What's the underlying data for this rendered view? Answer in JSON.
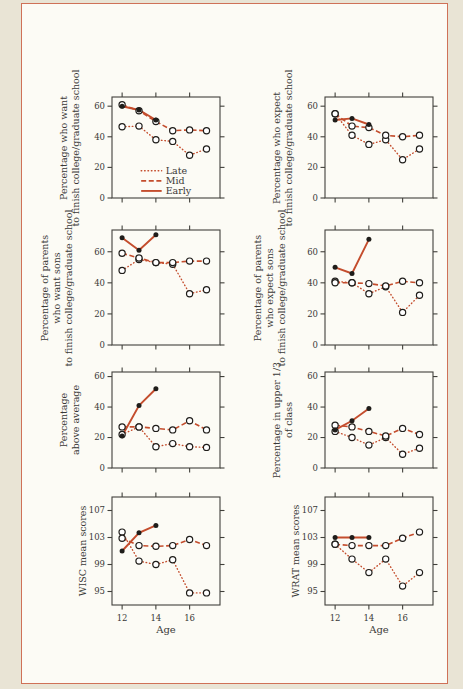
{
  "page": {
    "bg_outer": "#e9e4d5",
    "paper": "#fcfbf5",
    "frame_color": "#cf7157",
    "accent": "#c44d2d",
    "axis_color": "#41403b",
    "marker_color": "#1f1d1a",
    "text_color": "#3a3937"
  },
  "legend": {
    "items": [
      {
        "label": "Late",
        "style": "dotted"
      },
      {
        "label": "Mid",
        "style": "dashed"
      },
      {
        "label": "Early",
        "style": "solid"
      }
    ]
  },
  "x_axis": {
    "label": "Age",
    "ages": [
      12,
      13,
      14,
      15,
      16,
      17
    ],
    "ticks": [
      12,
      14,
      16
    ],
    "range": [
      11.4,
      17.8
    ]
  },
  "chart_data": [
    {
      "id": "chart-want-college",
      "type": "line",
      "ylabel": "Percentage who want\nto finish college/graduate school",
      "ylim": [
        0,
        66
      ],
      "yticks": [
        0,
        20,
        40,
        60
      ],
      "show_x_labels": false,
      "show_legend": true,
      "layout": {
        "x": 112,
        "y": 97,
        "w": 108,
        "h": 101
      },
      "series": [
        {
          "name": "Late",
          "style": "dotted",
          "marker": "open",
          "values": [
            46.5,
            47,
            38,
            37,
            28,
            32
          ]
        },
        {
          "name": "Mid",
          "style": "dashed",
          "marker": "open",
          "values": [
            61,
            57,
            50,
            44,
            44.5,
            44
          ]
        },
        {
          "name": "Early",
          "style": "solid",
          "marker": "filled",
          "values": [
            60,
            57.5,
            51,
            null,
            null,
            null
          ]
        }
      ]
    },
    {
      "id": "chart-expect-college",
      "type": "line",
      "ylabel": "Percentage who expect\nto finish college/graduate school",
      "ylim": [
        0,
        66
      ],
      "yticks": [
        0,
        20,
        40,
        60
      ],
      "show_x_labels": false,
      "show_legend": false,
      "layout": {
        "x": 325,
        "y": 97,
        "w": 108,
        "h": 101
      },
      "series": [
        {
          "name": "Late",
          "style": "dotted",
          "marker": "open",
          "values": [
            55,
            41,
            35,
            38,
            25,
            32
          ]
        },
        {
          "name": "Mid",
          "style": "dashed",
          "marker": "open",
          "values": [
            55,
            47,
            46,
            41,
            40,
            41
          ]
        },
        {
          "name": "Early",
          "style": "solid",
          "marker": "filled",
          "values": [
            51,
            52,
            48,
            null,
            null,
            null
          ]
        }
      ]
    },
    {
      "id": "chart-parents-want",
      "type": "line",
      "ylabel": "Percentage of parents\nwho want sons\nto finish college/graduate school",
      "ylim": [
        0,
        74
      ],
      "yticks": [
        0,
        20,
        40,
        60
      ],
      "show_x_labels": false,
      "show_legend": false,
      "layout": {
        "x": 112,
        "y": 230,
        "w": 108,
        "h": 115
      },
      "series": [
        {
          "name": "Late",
          "style": "dotted",
          "marker": "open",
          "values": [
            48,
            55,
            53,
            52,
            33,
            35.5
          ]
        },
        {
          "name": "Mid",
          "style": "dashed",
          "marker": "open",
          "values": [
            59,
            56,
            53,
            53,
            54,
            54
          ]
        },
        {
          "name": "Early",
          "style": "solid",
          "marker": "filled",
          "values": [
            69,
            61,
            71,
            null,
            null,
            null
          ]
        }
      ]
    },
    {
      "id": "chart-parents-expect",
      "type": "line",
      "ylabel": "Percentage of parents\nwho expect sons\nto finish college/graduate school",
      "ylim": [
        0,
        74
      ],
      "yticks": [
        0,
        20,
        40,
        60
      ],
      "show_x_labels": false,
      "show_legend": false,
      "layout": {
        "x": 325,
        "y": 230,
        "w": 108,
        "h": 115
      },
      "series": [
        {
          "name": "Late",
          "style": "dotted",
          "marker": "open",
          "values": [
            41,
            40,
            33,
            37.5,
            21,
            32
          ]
        },
        {
          "name": "Mid",
          "style": "dashed",
          "marker": "open",
          "values": [
            40,
            40,
            39.5,
            38,
            41,
            40
          ]
        },
        {
          "name": "Early",
          "style": "solid",
          "marker": "filled",
          "values": [
            50,
            46,
            68,
            null,
            null,
            null
          ]
        }
      ]
    },
    {
      "id": "chart-above-average",
      "type": "line",
      "ylabel": "Percentage\nabove average",
      "ylim": [
        0,
        63
      ],
      "yticks": [
        0,
        20,
        40,
        60
      ],
      "show_x_labels": false,
      "show_legend": false,
      "layout": {
        "x": 112,
        "y": 372,
        "w": 108,
        "h": 96
      },
      "series": [
        {
          "name": "Late",
          "style": "dotted",
          "marker": "open",
          "values": [
            22,
            27,
            14,
            16,
            14,
            13.5
          ]
        },
        {
          "name": "Mid",
          "style": "dashed",
          "marker": "open",
          "values": [
            27,
            27,
            26,
            25,
            31,
            25
          ]
        },
        {
          "name": "Early",
          "style": "solid",
          "marker": "filled",
          "values": [
            21,
            41,
            52,
            null,
            null,
            null
          ]
        }
      ]
    },
    {
      "id": "chart-upper-third",
      "type": "line",
      "ylabel": "Percentage in upper 1/3\nof class",
      "ylim": [
        0,
        63
      ],
      "yticks": [
        0,
        20,
        40,
        60
      ],
      "show_x_labels": false,
      "show_legend": false,
      "layout": {
        "x": 325,
        "y": 372,
        "w": 108,
        "h": 96
      },
      "series": [
        {
          "name": "Late",
          "style": "dotted",
          "marker": "open",
          "values": [
            24,
            20,
            15,
            20,
            9,
            13
          ]
        },
        {
          "name": "Mid",
          "style": "dashed",
          "marker": "open",
          "values": [
            28,
            27,
            24,
            21,
            26,
            22
          ]
        },
        {
          "name": "Early",
          "style": "solid",
          "marker": "filled",
          "values": [
            25,
            31,
            39,
            null,
            null,
            null
          ]
        }
      ]
    },
    {
      "id": "chart-wisc",
      "type": "line",
      "ylabel": "WISC mean scores",
      "ylim": [
        93,
        109
      ],
      "yticks": [
        95,
        99,
        103,
        107
      ],
      "show_x_labels": true,
      "show_legend": false,
      "layout": {
        "x": 112,
        "y": 497,
        "w": 108,
        "h": 108
      },
      "series": [
        {
          "name": "Late",
          "style": "dotted",
          "marker": "open",
          "values": [
            103.8,
            99.5,
            99,
            99.7,
            94.8,
            94.8
          ]
        },
        {
          "name": "Mid",
          "style": "dashed",
          "marker": "open",
          "values": [
            102.9,
            101.8,
            101.7,
            101.8,
            102.7,
            101.8
          ]
        },
        {
          "name": "Early",
          "style": "solid",
          "marker": "filled",
          "values": [
            101,
            103.7,
            104.8,
            null,
            null,
            null
          ]
        }
      ]
    },
    {
      "id": "chart-wrat",
      "type": "line",
      "ylabel": "WRAT mean scores",
      "ylim": [
        93,
        109
      ],
      "yticks": [
        95,
        99,
        103,
        107
      ],
      "show_x_labels": true,
      "show_legend": false,
      "layout": {
        "x": 325,
        "y": 497,
        "w": 108,
        "h": 108
      },
      "series": [
        {
          "name": "Late",
          "style": "dotted",
          "marker": "open",
          "values": [
            102,
            99.8,
            97.8,
            99.8,
            95.8,
            97.8
          ]
        },
        {
          "name": "Mid",
          "style": "dashed",
          "marker": "open",
          "values": [
            102,
            101.8,
            101.8,
            101.8,
            102.9,
            103.8
          ]
        },
        {
          "name": "Early",
          "style": "solid",
          "marker": "filled",
          "values": [
            103,
            103,
            103,
            null,
            null,
            null
          ]
        }
      ]
    }
  ]
}
